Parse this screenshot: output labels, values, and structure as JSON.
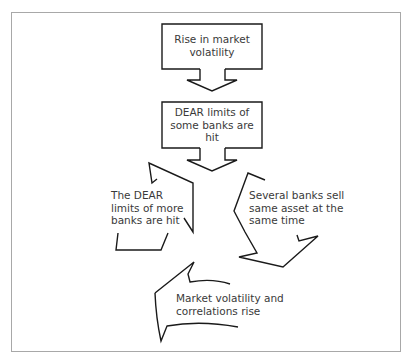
{
  "diagram": {
    "type": "flow-cycle",
    "colors": {
      "line": "#1a1a1a",
      "text": "#3a3a3a",
      "frame": "#a8a8a8",
      "background": "#ffffff"
    },
    "nodes": [
      {
        "id": "n1",
        "line1": "Rise in market",
        "line2": "volatility"
      },
      {
        "id": "n2",
        "line1": "DEAR limits of",
        "line2": "some banks are",
        "line3": "hit"
      },
      {
        "id": "n3",
        "line1": "Several banks sell",
        "line2": "same asset at the",
        "line3": "same time"
      },
      {
        "id": "n4",
        "line1": "Market volatility and",
        "line2": "correlations rise"
      },
      {
        "id": "n5",
        "line1": "The DEAR",
        "line2": "limits of more",
        "line3": "banks are hit"
      }
    ],
    "edges": [
      {
        "from": "n1",
        "to": "n2"
      },
      {
        "from": "n2",
        "to": "cycle"
      },
      {
        "from": "n3",
        "to": "n4"
      },
      {
        "from": "n4",
        "to": "n5"
      },
      {
        "from": "n5",
        "to": "n3"
      }
    ]
  }
}
